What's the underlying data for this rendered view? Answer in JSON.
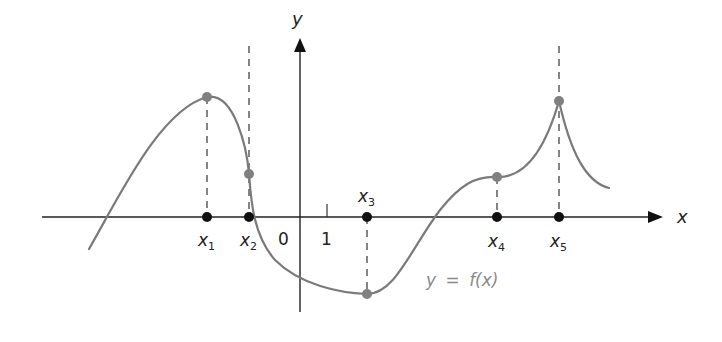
{
  "figure": {
    "colors": {
      "axis": "#222222",
      "curve": "#7a7a7a",
      "axis_point": "#111111",
      "curve_point": "#808080",
      "dashed": "#444444",
      "curve_label": "#8a8a8a"
    },
    "axes": {
      "x_label": "x",
      "y_label": "y",
      "origin_label": "0",
      "unit_tick_label": "1"
    },
    "points": [
      {
        "name": "x",
        "sub": "1",
        "role": "local maximum"
      },
      {
        "name": "x",
        "sub": "2",
        "role": "vertical tangent"
      },
      {
        "name": "x",
        "sub": "3",
        "role": "local minimum"
      },
      {
        "name": "x",
        "sub": "4",
        "role": "horizontal tangent (inflection)"
      },
      {
        "name": "x",
        "sub": "5",
        "role": "cusp / local maximum"
      }
    ],
    "curve_label": {
      "lhs": "y",
      "eq": "=",
      "rhs": "f(x)"
    }
  }
}
